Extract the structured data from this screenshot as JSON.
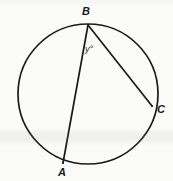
{
  "figure": {
    "kind": "circle-geometry-diagram",
    "width": 173,
    "height": 181,
    "background_color": "#fbfbfa",
    "stroke_color": "#1a1a1a",
    "circle": {
      "center_x": 88,
      "center_y": 94,
      "radius": 70,
      "stroke_width": 1.6
    },
    "points": [
      {
        "id": "B",
        "label": "B",
        "x": 88,
        "y": 25,
        "label_x": 82,
        "label_y": 6
      },
      {
        "id": "A",
        "label": "A",
        "x": 63,
        "y": 163,
        "label_x": 58,
        "label_y": 167
      },
      {
        "id": "C",
        "label": "C",
        "x": 152,
        "y": 106,
        "label_x": 157,
        "label_y": 104
      }
    ],
    "chords": [
      {
        "id": "chord-BA",
        "from": "B",
        "to": "A",
        "x1": 88,
        "y1": 25,
        "x2": 63,
        "y2": 163
      },
      {
        "id": "chord-BC",
        "from": "B",
        "to": "C",
        "x1": 88,
        "y1": 25,
        "x2": 152,
        "y2": 106
      }
    ],
    "angle": {
      "id": "angle-y",
      "vertex": "B",
      "label": "y°",
      "label_x": 85,
      "label_y": 45
    }
  }
}
